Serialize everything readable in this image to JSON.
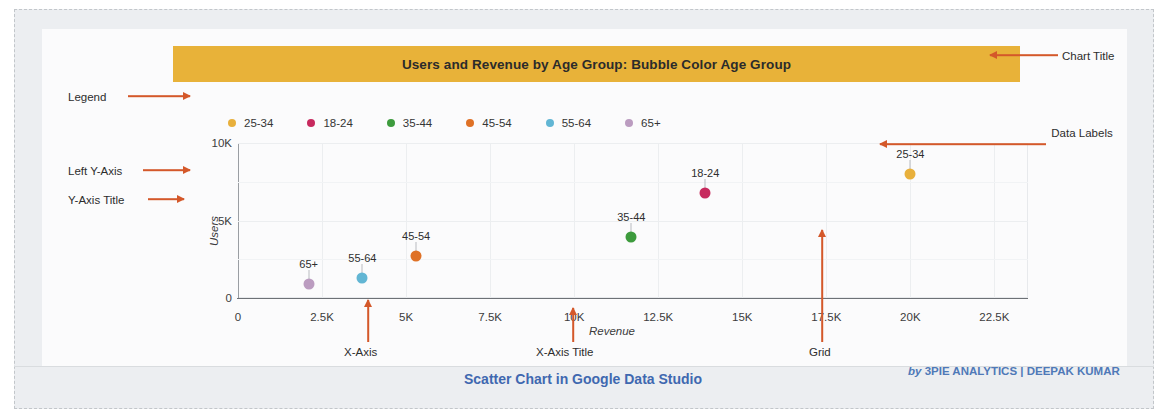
{
  "frame": {
    "background": "#eceef1",
    "border_color": "#c2c6ca"
  },
  "chart": {
    "title": "Users and Revenue by Age Group: Bubble Color Age Group",
    "title_bar_color": "#e8b239",
    "caption": "Scatter Chart in Google Data Studio",
    "credit_by": "by ",
    "credit_name": "3PIE ANALYTICS | DEEPAK KUMAR",
    "credit_color": "#4f79b8"
  },
  "legend": {
    "position": "top",
    "items": [
      {
        "label": "25-34",
        "color": "#e8b03c"
      },
      {
        "label": "18-24",
        "color": "#c72a5e"
      },
      {
        "label": "35-44",
        "color": "#3d9b3d"
      },
      {
        "label": "45-54",
        "color": "#df7126"
      },
      {
        "label": "55-64",
        "color": "#62b6d4"
      },
      {
        "label": "65+",
        "color": "#bb9cc0"
      }
    ]
  },
  "annotations": [
    {
      "name": "legend",
      "label": "Legend"
    },
    {
      "name": "left-y-axis",
      "label": "Left Y-Axis"
    },
    {
      "name": "y-axis-title",
      "label": "Y-Axis Title"
    },
    {
      "name": "chart-title",
      "label": "Chart Title"
    },
    {
      "name": "data-labels",
      "label": "Data Labels"
    },
    {
      "name": "x-axis",
      "label": "X-Axis"
    },
    {
      "name": "x-axis-title",
      "label": "X-Axis Title"
    },
    {
      "name": "grid",
      "label": "Grid"
    }
  ],
  "chart_data": {
    "type": "scatter",
    "title": "Users and Revenue by Age Group: Bubble Color Age Group",
    "xlabel": "Revenue",
    "ylabel": "Users",
    "xlim": [
      0,
      23500
    ],
    "ylim": [
      0,
      10000
    ],
    "xticks": [
      "0",
      "2.5K",
      "5K",
      "7.5K",
      "10K",
      "12.5K",
      "15K",
      "17.5K",
      "20K",
      "22.5K"
    ],
    "xtick_values": [
      0,
      2500,
      5000,
      7500,
      10000,
      12500,
      15000,
      17500,
      20000,
      22500
    ],
    "yticks": [
      "0",
      "5K",
      "10K"
    ],
    "ytick_values": [
      0,
      5000,
      10000
    ],
    "grid": true,
    "legend_position": "top",
    "points": [
      {
        "label": "25-34",
        "x": 20000,
        "y": 8000,
        "color": "#e8b03c"
      },
      {
        "label": "18-24",
        "x": 13900,
        "y": 6800,
        "color": "#c72a5e"
      },
      {
        "label": "35-44",
        "x": 11700,
        "y": 3950,
        "color": "#3d9b3d"
      },
      {
        "label": "45-54",
        "x": 5300,
        "y": 2700,
        "color": "#df7126"
      },
      {
        "label": "55-64",
        "x": 3700,
        "y": 1300,
        "color": "#62b6d4"
      },
      {
        "label": "65+",
        "x": 2100,
        "y": 900,
        "color": "#bb9cc0"
      }
    ]
  }
}
